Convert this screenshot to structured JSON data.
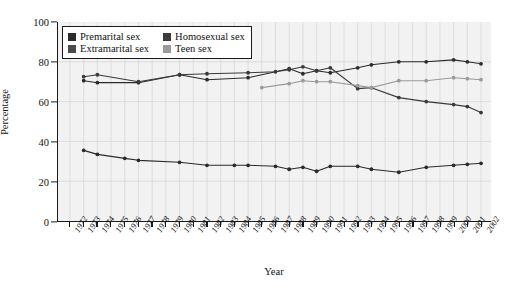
{
  "chart_data": {
    "type": "line",
    "title": "",
    "xlabel": "Year",
    "ylabel": "Percentage",
    "ylim": [
      0,
      100
    ],
    "yticks": [
      0,
      20,
      40,
      60,
      80,
      100
    ],
    "grid": true,
    "legend_position": "top-left",
    "x": [
      1972,
      1973,
      1974,
      1975,
      1976,
      1977,
      1978,
      1979,
      1980,
      1981,
      1982,
      1983,
      1984,
      1985,
      1986,
      1987,
      1988,
      1989,
      1990,
      1991,
      1992,
      1993,
      1994,
      1995,
      1996,
      1997,
      1998,
      1999,
      2000,
      2001,
      2002
    ],
    "xtick_labels": [
      "1972",
      "1973",
      "1974",
      "1975",
      "1976",
      "1977",
      "1978",
      "1979",
      "1980",
      "1981",
      "1982",
      "1983",
      "1984",
      "1985",
      "1986",
      "1987",
      "1988",
      "1989",
      "1990",
      "1991",
      "1992",
      "1993",
      "1994",
      "1995",
      "1996",
      "1997",
      "1998",
      "1999",
      "2000",
      "2001",
      "2002"
    ],
    "series": [
      {
        "name": "Premarital sex",
        "color": "#2b2b2b",
        "points": [
          {
            "x": 1973,
            "y": 70.5
          },
          {
            "x": 1974,
            "y": 69.5
          },
          {
            "x": 1977,
            "y": 69.5
          },
          {
            "x": 1980,
            "y": 73.5
          },
          {
            "x": 1982,
            "y": 71.0
          },
          {
            "x": 1985,
            "y": 72.0
          },
          {
            "x": 1988,
            "y": 76.5
          },
          {
            "x": 1989,
            "y": 74.0
          },
          {
            "x": 1990,
            "y": 75.5
          },
          {
            "x": 1991,
            "y": 74.5
          },
          {
            "x": 1993,
            "y": 77.0
          },
          {
            "x": 1994,
            "y": 78.5
          },
          {
            "x": 1996,
            "y": 80.0
          },
          {
            "x": 1998,
            "y": 80.0
          },
          {
            "x": 2000,
            "y": 81.0
          },
          {
            "x": 2001,
            "y": 80.0
          },
          {
            "x": 2002,
            "y": 79.0
          }
        ]
      },
      {
        "name": "Homosexual sex",
        "color": "#3a3a3a",
        "points": [
          {
            "x": 1973,
            "y": 72.5
          },
          {
            "x": 1974,
            "y": 73.5
          },
          {
            "x": 1977,
            "y": 70.0
          },
          {
            "x": 1980,
            "y": 73.5
          },
          {
            "x": 1982,
            "y": 74.0
          },
          {
            "x": 1985,
            "y": 74.5
          },
          {
            "x": 1987,
            "y": 75.0
          },
          {
            "x": 1988,
            "y": 76.0
          },
          {
            "x": 1989,
            "y": 77.5
          },
          {
            "x": 1990,
            "y": 75.5
          },
          {
            "x": 1991,
            "y": 77.0
          },
          {
            "x": 1993,
            "y": 66.5
          },
          {
            "x": 1994,
            "y": 67.0
          },
          {
            "x": 1996,
            "y": 62.0
          },
          {
            "x": 1998,
            "y": 60.0
          },
          {
            "x": 2000,
            "y": 58.5
          },
          {
            "x": 2001,
            "y": 57.5
          },
          {
            "x": 2002,
            "y": 54.5
          }
        ]
      },
      {
        "name": "Extramarital sex",
        "color": "#2b2b2b",
        "points": [
          {
            "x": 1973,
            "y": 35.5
          },
          {
            "x": 1974,
            "y": 33.5
          },
          {
            "x": 1976,
            "y": 31.5
          },
          {
            "x": 1977,
            "y": 30.5
          },
          {
            "x": 1980,
            "y": 29.5
          },
          {
            "x": 1982,
            "y": 28.0
          },
          {
            "x": 1984,
            "y": 28.0
          },
          {
            "x": 1985,
            "y": 28.0
          },
          {
            "x": 1987,
            "y": 27.5
          },
          {
            "x": 1988,
            "y": 26.0
          },
          {
            "x": 1989,
            "y": 27.0
          },
          {
            "x": 1990,
            "y": 25.0
          },
          {
            "x": 1991,
            "y": 27.5
          },
          {
            "x": 1993,
            "y": 27.5
          },
          {
            "x": 1994,
            "y": 26.0
          },
          {
            "x": 1996,
            "y": 24.5
          },
          {
            "x": 1998,
            "y": 27.0
          },
          {
            "x": 2000,
            "y": 28.0
          },
          {
            "x": 2001,
            "y": 28.5
          },
          {
            "x": 2002,
            "y": 29.0
          }
        ]
      },
      {
        "name": "Teen sex",
        "color": "#9a9a9a",
        "points": [
          {
            "x": 1986,
            "y": 67.0
          },
          {
            "x": 1988,
            "y": 69.0
          },
          {
            "x": 1989,
            "y": 70.5
          },
          {
            "x": 1990,
            "y": 70.0
          },
          {
            "x": 1991,
            "y": 70.0
          },
          {
            "x": 1993,
            "y": 68.0
          },
          {
            "x": 1994,
            "y": 67.0
          },
          {
            "x": 1996,
            "y": 70.5
          },
          {
            "x": 1998,
            "y": 70.5
          },
          {
            "x": 2000,
            "y": 72.0
          },
          {
            "x": 2001,
            "y": 71.5
          },
          {
            "x": 2002,
            "y": 71.0
          }
        ]
      }
    ]
  },
  "legend": {
    "entries": [
      {
        "label": "Premarital sex",
        "color": "#2b2b2b"
      },
      {
        "label": "Homosexual sex",
        "color": "#3a3a3a"
      },
      {
        "label": "Extramarital sex",
        "color": "#4a4a4a"
      },
      {
        "label": "Teen sex",
        "color": "#9a9a9a"
      }
    ]
  },
  "axes": {
    "x_title": "Year",
    "y_title": "Percentage"
  }
}
